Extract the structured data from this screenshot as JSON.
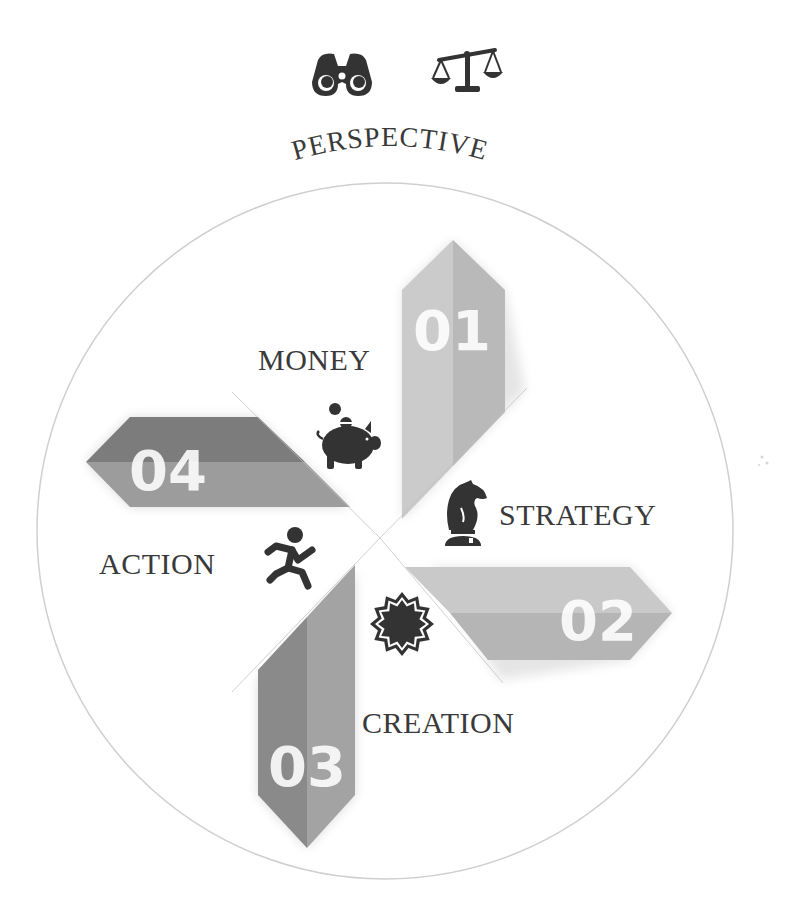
{
  "header": {
    "icons": [
      {
        "name": "binoculars-icon"
      },
      {
        "name": "scales-icon"
      }
    ],
    "title": "PERSPECTIVE"
  },
  "diagram": {
    "segments": [
      {
        "number": "01",
        "label": "STRATEGY",
        "icon": "chess-knight-icon",
        "fill_light": "#cbcbcb",
        "fill_dark": "#b9b9b9"
      },
      {
        "number": "02",
        "label": "CREATION",
        "icon": "starburst-icon",
        "fill_light": "#c9c9c9",
        "fill_dark": "#b5b5b5"
      },
      {
        "number": "03",
        "label": "ACTION",
        "icon": "running-person-icon",
        "fill_light": "#a3a3a3",
        "fill_dark": "#8a8a8a"
      },
      {
        "number": "04",
        "label": "MONEY",
        "icon": "piggy-bank-icon",
        "fill_light": "#9c9c9c",
        "fill_dark": "#7c7c7c"
      }
    ],
    "circle_color": "#cfcfcf",
    "icon_color": "#333333",
    "text_color": "#3a3a3a"
  }
}
